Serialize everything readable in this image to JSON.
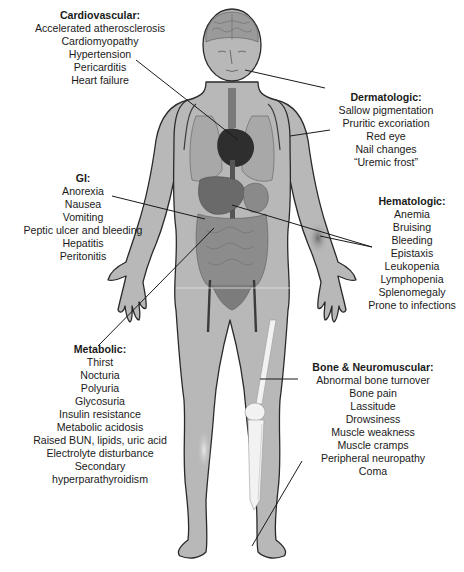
{
  "figure": {
    "colors": {
      "skin": "#b8b8b8",
      "outline": "#2a2a2a",
      "organ_dark": "#3a3a3a",
      "organ_mid": "#7a7a7a",
      "bone": "#f2f2f2",
      "leader_line": "#1a1a1a",
      "text": "#1a1a1a"
    }
  },
  "groups": {
    "cardiovascular": {
      "title": "Cardiovascular:",
      "items": [
        "Accelerated atherosclerosis",
        "Cardiomyopathy",
        "Hypertension",
        "Pericarditis",
        "Heart failure"
      ]
    },
    "dermatologic": {
      "title": "Dermatologic:",
      "items": [
        "Sallow pigmentation",
        "Pruritic excoriation",
        "Red eye",
        "Nail changes",
        "“Uremic frost”"
      ]
    },
    "gi": {
      "title": "GI:",
      "items": [
        "Anorexia",
        "Nausea",
        "Vomiting",
        "Peptic ulcer and bleeding",
        "Hepatitis",
        "Peritonitis"
      ]
    },
    "hematologic": {
      "title": "Hematologic:",
      "items": [
        "Anemia",
        "Bruising",
        "Bleeding",
        "Epistaxis",
        "Leukopenia",
        "Lymphopenia",
        "Splenomegaly",
        "Prone to infections"
      ]
    },
    "metabolic": {
      "title": "Metabolic:",
      "items": [
        "Thirst",
        "Nocturia",
        "Polyuria",
        "Glycosuria",
        "Insulin resistance",
        "Metabolic acidosis",
        "Raised BUN, lipids, uric acid",
        "Electrolyte disturbance",
        "Secondary",
        "hyperparathyroidism"
      ]
    },
    "bone_neuromuscular": {
      "title": "Bone & Neuromuscular:",
      "items": [
        "Abnormal bone turnover",
        "Bone pain",
        "Lassitude",
        "Drowsiness",
        "Muscle weakness",
        "Muscle cramps",
        "Peripheral neuropathy",
        "Coma"
      ]
    }
  }
}
